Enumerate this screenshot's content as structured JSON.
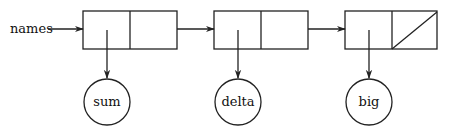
{
  "diagram": {
    "type": "linked-list",
    "head_label": "names",
    "nodes": [
      {
        "value": "sum",
        "next": "pointer"
      },
      {
        "value": "delta",
        "next": "pointer"
      },
      {
        "value": "big",
        "next": "null"
      }
    ],
    "colors": {
      "line": "#222222",
      "background": "#ffffff"
    }
  }
}
